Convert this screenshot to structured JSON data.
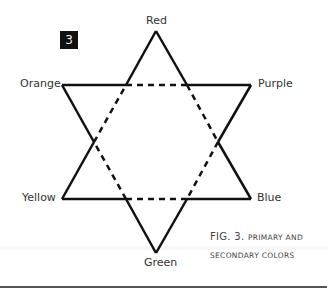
{
  "figure": {
    "badge": "3",
    "caption_prefix": "FIG. 3.",
    "caption_line1": "PRIMARY AND",
    "caption_line2": "SECONDARY COLORS"
  },
  "vertices": {
    "top": "Red",
    "upper_right": "Purple",
    "lower_right": "Blue",
    "bottom": "Green",
    "lower_left": "Yellow",
    "upper_left": "Orange"
  },
  "colors": {
    "stroke": "#111111",
    "text": "#333333"
  }
}
